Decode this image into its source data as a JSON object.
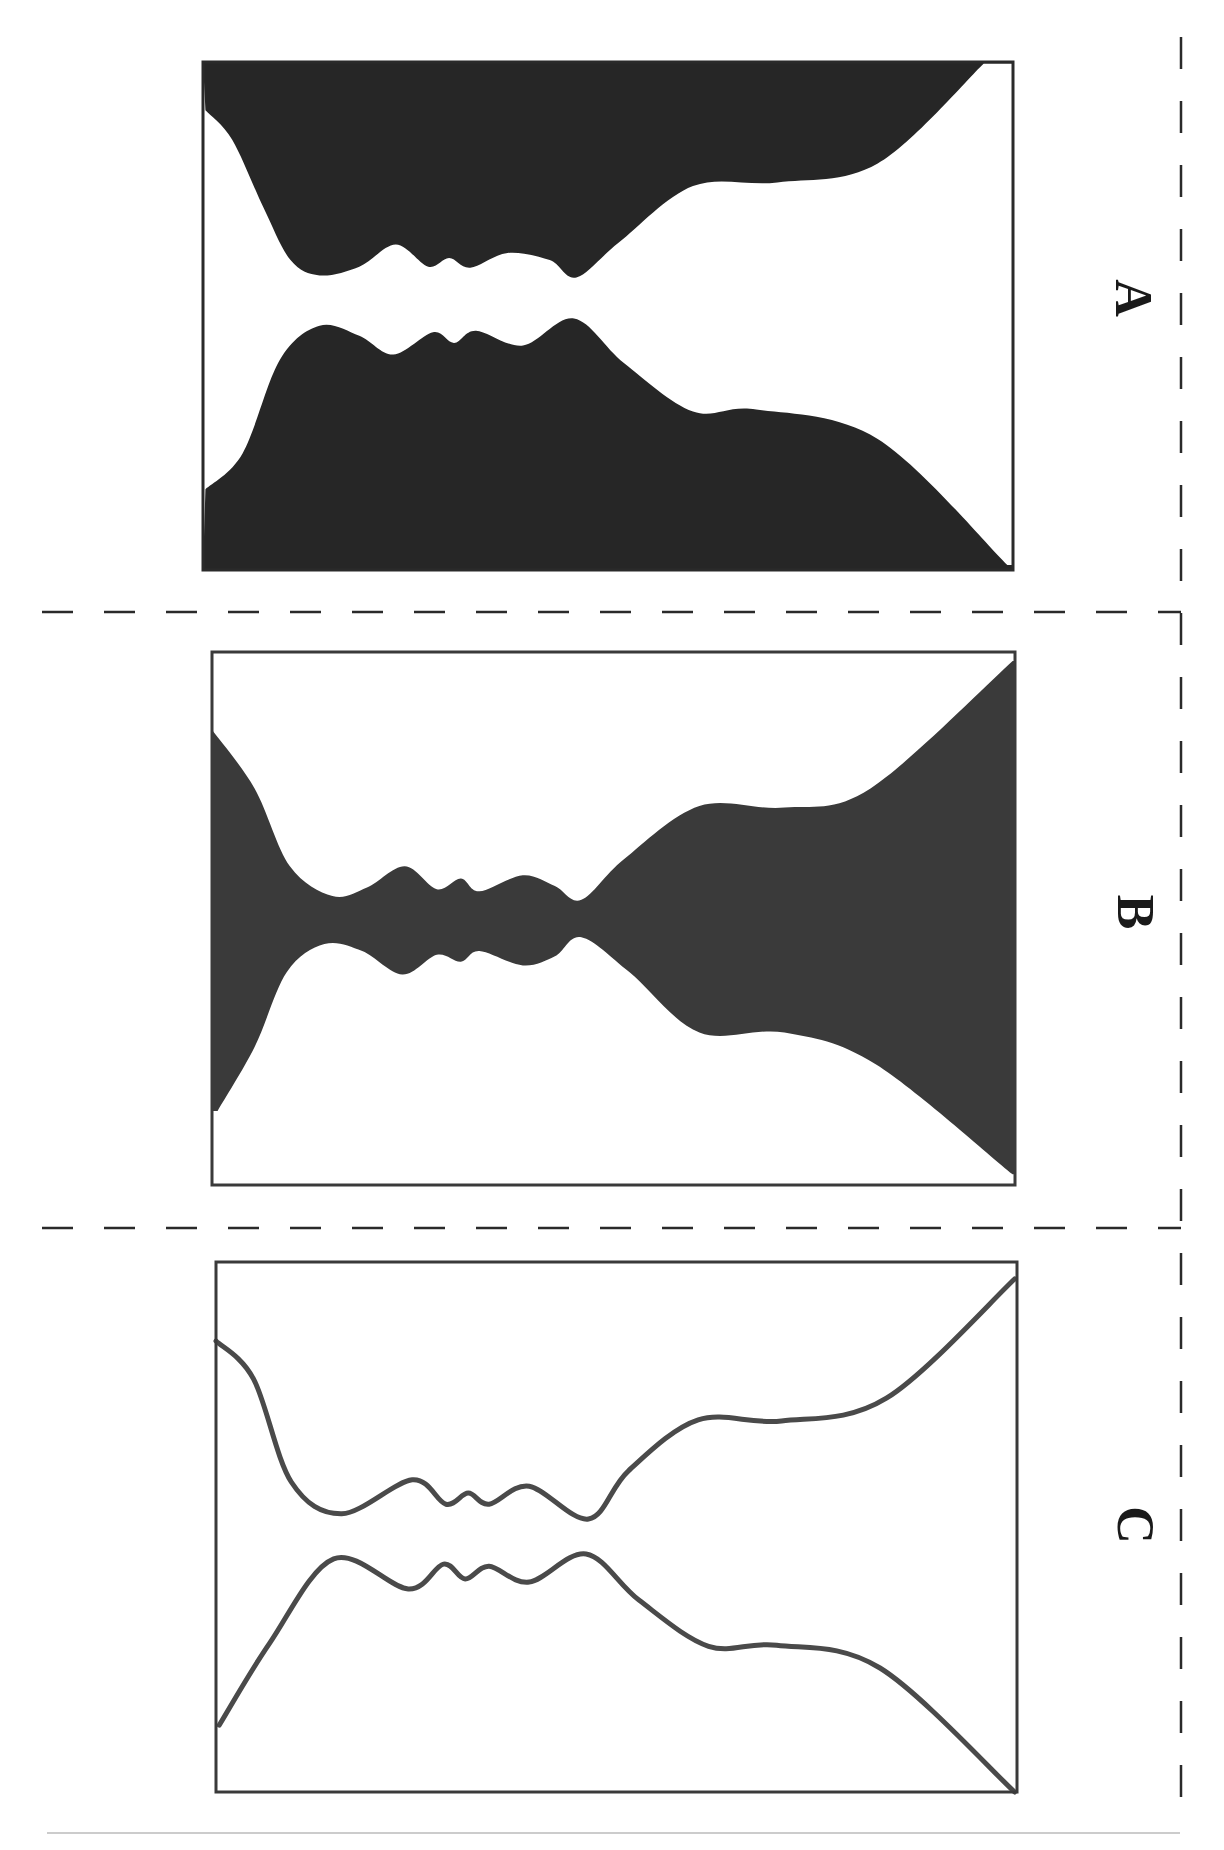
{
  "figure": {
    "colors": {
      "ink": "#2a2a2a",
      "fill_dark": "#262626",
      "fill_gray": "#3a3a3a",
      "outline": "#4a4a4a",
      "background": "#ffffff",
      "rule": "#9a9a9a"
    },
    "panels": [
      {
        "id": "A",
        "label": "A",
        "style": "faces-filled",
        "description": "Two facing profiles filled dark, vase is white",
        "top_profile": [
          [
            0.003,
            0.095
          ],
          [
            0.036,
            0.153
          ],
          [
            0.075,
            0.288
          ],
          [
            0.108,
            0.39
          ],
          [
            0.144,
            0.42
          ],
          [
            0.193,
            0.403
          ],
          [
            0.238,
            0.359
          ],
          [
            0.278,
            0.403
          ],
          [
            0.304,
            0.386
          ],
          [
            0.33,
            0.405
          ],
          [
            0.376,
            0.376
          ],
          [
            0.428,
            0.39
          ],
          [
            0.461,
            0.424
          ],
          [
            0.513,
            0.356
          ],
          [
            0.605,
            0.244
          ],
          [
            0.709,
            0.237
          ],
          [
            0.833,
            0.2
          ],
          [
            0.964,
            0.003
          ]
        ],
        "bottom_profile": [
          [
            0.003,
            0.841
          ],
          [
            0.049,
            0.77
          ],
          [
            0.095,
            0.586
          ],
          [
            0.144,
            0.519
          ],
          [
            0.193,
            0.539
          ],
          [
            0.235,
            0.576
          ],
          [
            0.284,
            0.532
          ],
          [
            0.31,
            0.553
          ],
          [
            0.337,
            0.529
          ],
          [
            0.395,
            0.558
          ],
          [
            0.458,
            0.505
          ],
          [
            0.52,
            0.593
          ],
          [
            0.605,
            0.688
          ],
          [
            0.683,
            0.684
          ],
          [
            0.833,
            0.742
          ],
          [
            0.993,
            0.99
          ]
        ]
      },
      {
        "id": "B",
        "label": "B",
        "style": "vase-filled",
        "description": "Vase filled dark, faces are white",
        "top_profile": [
          [
            0,
            0.146
          ],
          [
            0.053,
            0.256
          ],
          [
            0.097,
            0.402
          ],
          [
            0.15,
            0.458
          ],
          [
            0.193,
            0.442
          ],
          [
            0.24,
            0.402
          ],
          [
            0.28,
            0.445
          ],
          [
            0.31,
            0.425
          ],
          [
            0.333,
            0.449
          ],
          [
            0.387,
            0.419
          ],
          [
            0.427,
            0.439
          ],
          [
            0.46,
            0.465
          ],
          [
            0.513,
            0.389
          ],
          [
            0.607,
            0.289
          ],
          [
            0.713,
            0.292
          ],
          [
            0.82,
            0.256
          ],
          [
            0.997,
            0.017
          ]
        ],
        "bottom_profile": [
          [
            0.007,
            0.861
          ],
          [
            0.053,
            0.741
          ],
          [
            0.093,
            0.601
          ],
          [
            0.14,
            0.548
          ],
          [
            0.187,
            0.561
          ],
          [
            0.237,
            0.605
          ],
          [
            0.28,
            0.568
          ],
          [
            0.31,
            0.581
          ],
          [
            0.333,
            0.561
          ],
          [
            0.387,
            0.588
          ],
          [
            0.427,
            0.571
          ],
          [
            0.46,
            0.535
          ],
          [
            0.52,
            0.601
          ],
          [
            0.607,
            0.714
          ],
          [
            0.713,
            0.714
          ],
          [
            0.827,
            0.774
          ],
          [
            0.997,
            0.98
          ]
        ]
      },
      {
        "id": "C",
        "label": "C",
        "style": "outline-only",
        "description": "Outline only, ambiguous figure-ground",
        "top_profile": [
          [
            0,
            0.149
          ],
          [
            0.047,
            0.221
          ],
          [
            0.094,
            0.415
          ],
          [
            0.157,
            0.475
          ],
          [
            0.245,
            0.411
          ],
          [
            0.287,
            0.457
          ],
          [
            0.315,
            0.436
          ],
          [
            0.341,
            0.457
          ],
          [
            0.391,
            0.423
          ],
          [
            0.465,
            0.485
          ],
          [
            0.515,
            0.394
          ],
          [
            0.602,
            0.298
          ],
          [
            0.706,
            0.3
          ],
          [
            0.837,
            0.257
          ],
          [
            0.997,
            0.032
          ]
        ],
        "bottom_profile": [
          [
            0.004,
            0.874
          ],
          [
            0.067,
            0.719
          ],
          [
            0.147,
            0.56
          ],
          [
            0.24,
            0.617
          ],
          [
            0.284,
            0.57
          ],
          [
            0.311,
            0.598
          ],
          [
            0.341,
            0.574
          ],
          [
            0.391,
            0.604
          ],
          [
            0.462,
            0.551
          ],
          [
            0.528,
            0.638
          ],
          [
            0.615,
            0.725
          ],
          [
            0.7,
            0.723
          ],
          [
            0.829,
            0.766
          ],
          [
            0.997,
            1.0
          ]
        ]
      }
    ]
  }
}
